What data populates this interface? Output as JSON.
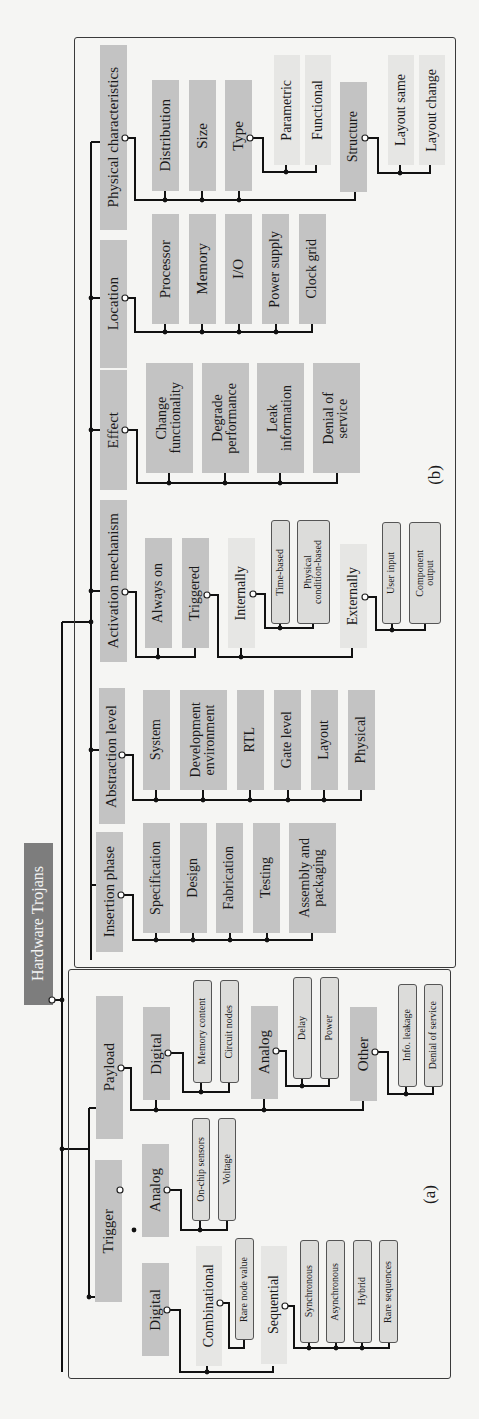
{
  "title": "Hardware Trojans",
  "frames": [
    {
      "id": "b",
      "label": "(b)",
      "x": 74,
      "y": 37,
      "w": 382,
      "h": 931,
      "label_x": 425,
      "label_y": 465
    },
    {
      "id": "a",
      "label": "(a)",
      "x": 68,
      "y": 969,
      "w": 383,
      "h": 410,
      "label_x": 420,
      "label_y": 1185
    }
  ],
  "boxes": [
    {
      "id": "root",
      "text": "Hardware Trojans",
      "style": "root",
      "x": 24,
      "y": 843,
      "w": 29,
      "h": 162,
      "fs": 16
    },
    {
      "id": "physical",
      "text": "Physical characteristics",
      "style": "dark",
      "x": 100,
      "y": 45,
      "w": 27,
      "h": 185,
      "fs": 15
    },
    {
      "id": "distribution",
      "text": "Distribution",
      "style": "dark",
      "x": 152,
      "y": 80,
      "w": 27,
      "h": 111,
      "fs": 15
    },
    {
      "id": "size",
      "text": "Size",
      "style": "dark",
      "x": 189,
      "y": 80,
      "w": 27,
      "h": 111,
      "fs": 15
    },
    {
      "id": "type",
      "text": "Type",
      "style": "dark",
      "x": 225,
      "y": 80,
      "w": 27,
      "h": 111,
      "fs": 15
    },
    {
      "id": "parametric",
      "text": "Parametric",
      "style": "light",
      "x": 274,
      "y": 55,
      "w": 26,
      "h": 110,
      "fs": 14
    },
    {
      "id": "functional",
      "text": "Functional",
      "style": "light",
      "x": 305,
      "y": 55,
      "w": 26,
      "h": 110,
      "fs": 14
    },
    {
      "id": "structure",
      "text": "Structure",
      "style": "dark",
      "x": 340,
      "y": 82,
      "w": 27,
      "h": 110,
      "fs": 14
    },
    {
      "id": "layout_same",
      "text": "Layout same",
      "style": "light",
      "x": 388,
      "y": 55,
      "w": 26,
      "h": 110,
      "fs": 14
    },
    {
      "id": "layout_change",
      "text": "Layout change",
      "style": "light",
      "x": 419,
      "y": 55,
      "w": 26,
      "h": 110,
      "fs": 14
    },
    {
      "id": "location",
      "text": "Location",
      "style": "dark",
      "x": 100,
      "y": 240,
      "w": 27,
      "h": 128,
      "fs": 15
    },
    {
      "id": "processor",
      "text": "Processor",
      "style": "dark",
      "x": 152,
      "y": 214,
      "w": 27,
      "h": 110,
      "fs": 15
    },
    {
      "id": "memory",
      "text": "Memory",
      "style": "dark",
      "x": 189,
      "y": 214,
      "w": 27,
      "h": 110,
      "fs": 15
    },
    {
      "id": "io",
      "text": "I/O",
      "style": "dark",
      "x": 225,
      "y": 214,
      "w": 27,
      "h": 110,
      "fs": 15
    },
    {
      "id": "power_supply",
      "text": "Power supply",
      "style": "dark",
      "x": 262,
      "y": 214,
      "w": 27,
      "h": 110,
      "fs": 14
    },
    {
      "id": "clock_grid",
      "text": "Clock grid",
      "style": "dark",
      "x": 299,
      "y": 214,
      "w": 27,
      "h": 110,
      "fs": 14
    },
    {
      "id": "effect",
      "text": "Effect",
      "style": "dark",
      "x": 100,
      "y": 370,
      "w": 27,
      "h": 120,
      "fs": 15
    },
    {
      "id": "change_func",
      "text": "Change\nfunctionality",
      "style": "dark",
      "x": 146,
      "y": 363,
      "w": 47,
      "h": 110,
      "fs": 14
    },
    {
      "id": "degrade_perf",
      "text": "Degrade\nperformance",
      "style": "dark",
      "x": 202,
      "y": 363,
      "w": 47,
      "h": 110,
      "fs": 14
    },
    {
      "id": "leak_info",
      "text": "Leak\ninformation",
      "style": "dark",
      "x": 257,
      "y": 363,
      "w": 47,
      "h": 110,
      "fs": 14
    },
    {
      "id": "denial_service_b",
      "text": "Denial of\nservice",
      "style": "dark",
      "x": 313,
      "y": 363,
      "w": 47,
      "h": 110,
      "fs": 14
    },
    {
      "id": "activation",
      "text": "Activation mechanism",
      "style": "dark",
      "x": 100,
      "y": 500,
      "w": 27,
      "h": 162,
      "fs": 15
    },
    {
      "id": "always_on",
      "text": "Always on",
      "style": "dark",
      "x": 145,
      "y": 538,
      "w": 27,
      "h": 110,
      "fs": 14
    },
    {
      "id": "triggered",
      "text": "Triggered",
      "style": "dark",
      "x": 182,
      "y": 538,
      "w": 27,
      "h": 110,
      "fs": 14
    },
    {
      "id": "internally",
      "text": "Internally",
      "style": "light",
      "x": 228,
      "y": 538,
      "w": 27,
      "h": 110,
      "fs": 14
    },
    {
      "id": "time_based",
      "text": "Time-based",
      "style": "pill",
      "x": 271,
      "y": 520,
      "w": 19,
      "h": 104,
      "fs": 10
    },
    {
      "id": "phys_cond",
      "text": "Physical\ncondition-based",
      "style": "pill",
      "x": 297,
      "y": 520,
      "w": 33,
      "h": 104,
      "fs": 10
    },
    {
      "id": "externally",
      "text": "Externally",
      "style": "light",
      "x": 340,
      "y": 544,
      "w": 27,
      "h": 104,
      "fs": 14
    },
    {
      "id": "user_input",
      "text": "User input",
      "style": "pill",
      "x": 382,
      "y": 522,
      "w": 19,
      "h": 102,
      "fs": 10
    },
    {
      "id": "component_output",
      "text": "Component\noutput",
      "style": "pill",
      "x": 409,
      "y": 522,
      "w": 32,
      "h": 102,
      "fs": 10
    },
    {
      "id": "abstraction",
      "text": "Abstraction level",
      "style": "dark",
      "x": 99,
      "y": 688,
      "w": 26,
      "h": 136,
      "fs": 15
    },
    {
      "id": "system",
      "text": "System",
      "style": "dark",
      "x": 143,
      "y": 690,
      "w": 27,
      "h": 100,
      "fs": 14
    },
    {
      "id": "dev_env",
      "text": "Development\nenvironment",
      "style": "dark",
      "x": 180,
      "y": 690,
      "w": 47,
      "h": 100,
      "fs": 14
    },
    {
      "id": "rtl",
      "text": "RTL",
      "style": "dark",
      "x": 237,
      "y": 690,
      "w": 27,
      "h": 100,
      "fs": 14
    },
    {
      "id": "gate_level",
      "text": "Gate level",
      "style": "dark",
      "x": 274,
      "y": 690,
      "w": 27,
      "h": 100,
      "fs": 14
    },
    {
      "id": "layout",
      "text": "Layout",
      "style": "dark",
      "x": 311,
      "y": 690,
      "w": 27,
      "h": 100,
      "fs": 14
    },
    {
      "id": "physical_b",
      "text": "Physical",
      "style": "dark",
      "x": 348,
      "y": 690,
      "w": 27,
      "h": 100,
      "fs": 14
    },
    {
      "id": "insertion",
      "text": "Insertion phase",
      "style": "dark",
      "x": 96,
      "y": 832,
      "w": 27,
      "h": 120,
      "fs": 15
    },
    {
      "id": "specification",
      "text": "Specification",
      "style": "dark",
      "x": 143,
      "y": 823,
      "w": 27,
      "h": 110,
      "fs": 14
    },
    {
      "id": "design",
      "text": "Design",
      "style": "dark",
      "x": 180,
      "y": 823,
      "w": 27,
      "h": 110,
      "fs": 14
    },
    {
      "id": "fabrication",
      "text": "Fabrication",
      "style": "dark",
      "x": 216,
      "y": 823,
      "w": 27,
      "h": 110,
      "fs": 14
    },
    {
      "id": "testing",
      "text": "Testing",
      "style": "dark",
      "x": 253,
      "y": 823,
      "w": 27,
      "h": 110,
      "fs": 14
    },
    {
      "id": "assembly",
      "text": "Assembly and\npackaging",
      "style": "dark",
      "x": 289,
      "y": 823,
      "w": 47,
      "h": 110,
      "fs": 14
    },
    {
      "id": "payload",
      "text": "Payload",
      "style": "dark",
      "x": 96,
      "y": 996,
      "w": 27,
      "h": 143,
      "fs": 15
    },
    {
      "id": "p_digital",
      "text": "Digital",
      "style": "dark",
      "x": 143,
      "y": 1007,
      "w": 27,
      "h": 93,
      "fs": 15
    },
    {
      "id": "memory_content",
      "text": "Memory content",
      "style": "pill",
      "x": 193,
      "y": 980,
      "w": 19,
      "h": 103,
      "fs": 10
    },
    {
      "id": "circuit_nodes",
      "text": "Circuit nodes",
      "style": "pill",
      "x": 220,
      "y": 980,
      "w": 19,
      "h": 103,
      "fs": 10
    },
    {
      "id": "p_analog",
      "text": "Analog",
      "style": "dark",
      "x": 251,
      "y": 1006,
      "w": 27,
      "h": 93,
      "fs": 15
    },
    {
      "id": "delay",
      "text": "Delay",
      "style": "pill",
      "x": 293,
      "y": 977,
      "w": 19,
      "h": 102,
      "fs": 10
    },
    {
      "id": "power",
      "text": "Power",
      "style": "pill",
      "x": 320,
      "y": 977,
      "w": 19,
      "h": 102,
      "fs": 10
    },
    {
      "id": "other",
      "text": "Other",
      "style": "dark",
      "x": 350,
      "y": 1007,
      "w": 27,
      "h": 94,
      "fs": 15
    },
    {
      "id": "info_leakage",
      "text": "Info. leakage",
      "style": "pill",
      "x": 398,
      "y": 984,
      "w": 19,
      "h": 103,
      "fs": 10
    },
    {
      "id": "denial_service_a",
      "text": "Denial of service",
      "style": "pill",
      "x": 424,
      "y": 984,
      "w": 19,
      "h": 103,
      "fs": 10
    },
    {
      "id": "trigger",
      "text": "Trigger",
      "style": "dark",
      "x": 95,
      "y": 1160,
      "w": 27,
      "h": 142,
      "fs": 15
    },
    {
      "id": "t_analog",
      "text": "Analog",
      "style": "dark",
      "x": 142,
      "y": 1144,
      "w": 27,
      "h": 93,
      "fs": 15
    },
    {
      "id": "onchip",
      "text": "On-chip sensors",
      "style": "pill",
      "x": 192,
      "y": 1118,
      "w": 18,
      "h": 103,
      "fs": 10
    },
    {
      "id": "voltage",
      "text": "Voltage",
      "style": "pill",
      "x": 218,
      "y": 1118,
      "w": 18,
      "h": 103,
      "fs": 10
    },
    {
      "id": "t_digital",
      "text": "Digital",
      "style": "dark",
      "x": 142,
      "y": 1263,
      "w": 27,
      "h": 93,
      "fs": 15
    },
    {
      "id": "combinational",
      "text": "Combinational",
      "style": "light",
      "x": 196,
      "y": 1246,
      "w": 26,
      "h": 120,
      "fs": 14
    },
    {
      "id": "rare_node",
      "text": "Rare node value",
      "style": "pill",
      "x": 235,
      "y": 1238,
      "w": 19,
      "h": 102,
      "fs": 10
    },
    {
      "id": "sequential",
      "text": "Sequential",
      "style": "light",
      "x": 261,
      "y": 1246,
      "w": 26,
      "h": 118,
      "fs": 14
    },
    {
      "id": "synchronous",
      "text": "Synchronous",
      "style": "pill",
      "x": 300,
      "y": 1240,
      "w": 19,
      "h": 103,
      "fs": 10
    },
    {
      "id": "asynchronous",
      "text": "Asynchronous",
      "style": "pill",
      "x": 326,
      "y": 1240,
      "w": 19,
      "h": 103,
      "fs": 10
    },
    {
      "id": "hybrid",
      "text": "Hybrid",
      "style": "pill",
      "x": 353,
      "y": 1240,
      "w": 19,
      "h": 103,
      "fs": 10
    },
    {
      "id": "rare_sequences",
      "text": "Rare sequences",
      "style": "pill",
      "x": 379,
      "y": 1240,
      "w": 19,
      "h": 103,
      "fs": 10
    }
  ],
  "lines": [
    "M52 1000 L62 1000",
    "M62 622 L62 1372",
    "M62 622 L91 622",
    "M91 142 L91 960",
    "M91 142 L100 142",
    "M91 298 L100 298",
    "M91 430 L100 430",
    "M91 591 L100 591",
    "M91 445 L91 446",
    "M91 750 L99 750",
    "M91 885 L96 885",
    "M62 1149 L89 1149",
    "M89 1108 L89 1297",
    "M89 1108 L96 1108",
    "M89 1297 L95 1297",
    "M128 138 L135 138 L135 200 L355 200 L355 192",
    "M165 200 L165 191",
    "M202 200 L202 191",
    "M239 200 L239 191",
    "M253 138 L263 138 L263 172 L316 172 L316 165",
    "M286 172 L286 165",
    "M368 138 L378 138 L378 173 L430 173 L430 165",
    "M400 173 L400 165",
    "M128 298 L135 298 L135 332 L312 332 L312 324",
    "M165 332 L165 324",
    "M202 332 L202 324",
    "M239 332 L239 324",
    "M276 332 L276 324",
    "M128 430 L137 430 L137 483 L337 483 L337 473",
    "M169 483 L169 473",
    "M225 483 L225 473",
    "M280 483 L280 473",
    "M128 592 L136 592 L136 657 L195 657 L195 648",
    "M158 657 L158 648",
    "M210 595 L218 595 L218 657 L352 657 L352 648",
    "M241 657 L241 648",
    "M255 594 L265 594 L265 628 L313 628 L313 624",
    "M280 628 L280 624",
    "M367 597 L376 597 L376 630 L425 630 L425 624",
    "M392 630 L392 624",
    "M125 755 L133 755 L133 800 L361 800 L361 790",
    "M156 800 L156 790",
    "M203 800 L203 790",
    "M250 800 L250 790",
    "M288 800 L288 790",
    "M324 800 L324 790",
    "M123 895 L133 895 L133 940 L312 940 L312 933",
    "M156 940 L156 933",
    "M193 940 L193 933",
    "M230 940 L230 933",
    "M267 940 L267 933",
    "M123 1068 L131 1068 L131 1110 L363 1110 L363 1101",
    "M156 1110 L156 1100",
    "M264 1110 L264 1099",
    "M170 1053 L183 1053 L183 1092 L229 1092 L229 1083",
    "M201 1092 L201 1083",
    "M278 1051 L286 1051 L286 1086 L329 1086 L329 1079",
    "M302 1086 L302 1079",
    "M377 1052 L388 1052 L388 1094 L433 1094 L433 1087",
    "M406 1094 L406 1087",
    "M169 1190 L181 1190 L181 1230 L227 1230 L227 1221",
    "M200 1230 L200 1221",
    "M169 1310 L180 1310 L180 1372 L273 1372 L273 1366",
    "M207 1372 L207 1366",
    "M222 1303 L229 1303 L229 1348 L244 1348 L244 1340",
    "M287 1306 L294 1306 L294 1348 L389 1348 L389 1343",
    "M309 1348 L309 1343",
    "M336 1348 L336 1343",
    "M362 1348 L362 1343"
  ],
  "dots": [
    [
      62,
      1000
    ],
    [
      91,
      622
    ],
    [
      91,
      298
    ],
    [
      91,
      430
    ],
    [
      91,
      591
    ],
    [
      91,
      750
    ],
    [
      62,
      1149
    ],
    [
      89,
      1297
    ],
    [
      165,
      200
    ],
    [
      202,
      200
    ],
    [
      239,
      200
    ],
    [
      286,
      172
    ],
    [
      400,
      173
    ],
    [
      165,
      332
    ],
    [
      202,
      332
    ],
    [
      239,
      332
    ],
    [
      276,
      332
    ],
    [
      169,
      483
    ],
    [
      225,
      483
    ],
    [
      280,
      483
    ],
    [
      158,
      657
    ],
    [
      241,
      657
    ],
    [
      280,
      628
    ],
    [
      392,
      630
    ],
    [
      156,
      800
    ],
    [
      203,
      800
    ],
    [
      250,
      800
    ],
    [
      288,
      800
    ],
    [
      324,
      800
    ],
    [
      156,
      940
    ],
    [
      193,
      940
    ],
    [
      230,
      940
    ],
    [
      267,
      940
    ],
    [
      156,
      1110
    ],
    [
      264,
      1110
    ],
    [
      201,
      1092
    ],
    [
      302,
      1086
    ],
    [
      406,
      1094
    ],
    [
      200,
      1230
    ],
    [
      207,
      1372
    ],
    [
      309,
      1348
    ],
    [
      336,
      1348
    ],
    [
      362,
      1348
    ],
    [
      134,
      1230
    ]
  ],
  "open_dots": [
    [
      52,
      1000
    ],
    [
      125,
      138
    ],
    [
      250,
      138
    ],
    [
      365,
      138
    ],
    [
      125,
      298
    ],
    [
      125,
      430
    ],
    [
      125,
      592
    ],
    [
      207,
      595
    ],
    [
      253,
      594
    ],
    [
      365,
      597
    ],
    [
      122,
      755
    ],
    [
      121,
      895
    ],
    [
      121,
      1068
    ],
    [
      168,
      1053
    ],
    [
      276,
      1051
    ],
    [
      375,
      1052
    ],
    [
      120,
      1190
    ],
    [
      167,
      1190
    ],
    [
      167,
      1310
    ],
    [
      220,
      1303
    ],
    [
      285,
      1306
    ]
  ]
}
